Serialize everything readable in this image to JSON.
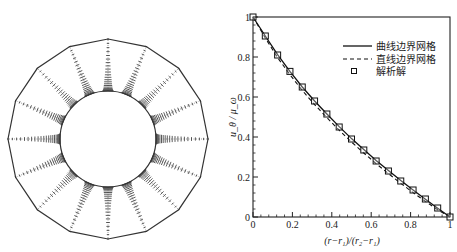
{
  "mesh_panel": {
    "description": "Annular mesh between inner circle and outer 16-sided polygon with radial grid lines clustered near inner wall",
    "center": [
      108,
      139
    ],
    "outer_radius": 100,
    "inner_radius": 48,
    "sides": 16,
    "radial_nodes": 22,
    "stroke": "#333333"
  },
  "chart_data": {
    "type": "line",
    "title": "",
    "xlabel": "(r−r₁)/(r₂−r₁)",
    "ylabel": "u_θ / μ_ω",
    "xlim": [
      0,
      1
    ],
    "ylim": [
      0,
      1
    ],
    "xticks": [
      "0",
      "0.2",
      "0.4",
      "0.6",
      "0.8",
      "1"
    ],
    "yticks": [
      "0",
      "0.2",
      "0.4",
      "0.6",
      "0.8",
      "1"
    ],
    "grid": false,
    "legend_position": "upper right",
    "legend": [
      "曲线边界网格",
      "直线边界网格",
      "解析解"
    ],
    "series": [
      {
        "name": "曲线边界网格",
        "style": "solid",
        "x": [
          0,
          0.0625,
          0.125,
          0.1875,
          0.25,
          0.3125,
          0.375,
          0.4375,
          0.5,
          0.5625,
          0.625,
          0.6875,
          0.75,
          0.8125,
          0.875,
          0.9375,
          1
        ],
        "y": [
          1,
          0.905,
          0.812,
          0.728,
          0.65,
          0.58,
          0.515,
          0.452,
          0.392,
          0.337,
          0.283,
          0.232,
          0.182,
          0.135,
          0.089,
          0.044,
          0
        ]
      },
      {
        "name": "直线边界网格",
        "style": "dashed",
        "x": [
          0,
          0.0625,
          0.125,
          0.1875,
          0.25,
          0.3125,
          0.375,
          0.4375,
          0.5,
          0.5625,
          0.625,
          0.6875,
          0.75,
          0.8125,
          0.875,
          0.9375,
          1
        ],
        "y": [
          1,
          0.895,
          0.797,
          0.712,
          0.633,
          0.562,
          0.497,
          0.434,
          0.375,
          0.32,
          0.267,
          0.217,
          0.168,
          0.122,
          0.078,
          0.036,
          0
        ]
      },
      {
        "name": "解析解",
        "style": "square-markers",
        "x": [
          0,
          0.0625,
          0.125,
          0.1875,
          0.25,
          0.3125,
          0.375,
          0.4375,
          0.5,
          0.5625,
          0.625,
          0.6875,
          0.75,
          0.8125,
          0.875,
          0.9375,
          1
        ],
        "y": [
          1,
          0.905,
          0.81,
          0.728,
          0.65,
          0.58,
          0.515,
          0.45,
          0.39,
          0.335,
          0.28,
          0.23,
          0.18,
          0.135,
          0.09,
          0.045,
          0
        ]
      }
    ]
  },
  "plot_area": {
    "left": 253,
    "top": 17,
    "right": 450,
    "bottom": 217
  },
  "colors": {
    "line": "#111111",
    "axis": "#222222",
    "background": "#ffffff"
  }
}
